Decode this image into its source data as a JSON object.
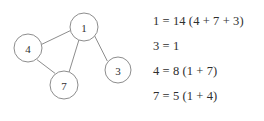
{
  "graph": {
    "nodes": [
      {
        "id": "n1",
        "label": "1",
        "cx": 84,
        "cy": 27,
        "r": 14
      },
      {
        "id": "n4",
        "label": "4",
        "cx": 28,
        "cy": 48,
        "r": 14
      },
      {
        "id": "n7",
        "label": "7",
        "cx": 64,
        "cy": 85,
        "r": 14
      },
      {
        "id": "n3",
        "label": "3",
        "cx": 118,
        "cy": 70,
        "r": 13
      }
    ],
    "edges": [
      {
        "from": "4",
        "to": "1"
      },
      {
        "from": "1",
        "to": "3"
      },
      {
        "from": "1",
        "to": "7"
      },
      {
        "from": "4",
        "to": "7"
      }
    ],
    "node_stroke_color": "#8d8d8d",
    "edge_stroke_color": "#8d8d8d",
    "node_fill_color": "#ffffff",
    "label_color": "#2f2f2f"
  },
  "equations": {
    "text_color": "#2e2e2e",
    "lines": [
      "1 = 14 (4 + 7 + 3)",
      "3 = 1",
      "4 = 8 (1 + 7)",
      "7 = 5 (1 + 4)"
    ]
  },
  "page": {
    "background_color": "#ffffff"
  }
}
